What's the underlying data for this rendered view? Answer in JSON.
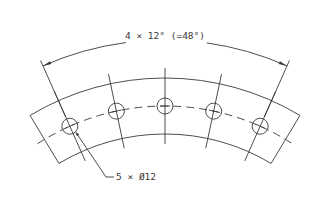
{
  "drawing": {
    "type": "technical-drawing",
    "subject": "curved segment with bolt-hole pattern",
    "angular_dimension": {
      "label": "4 × 12° (=48°)",
      "count": 4,
      "step_deg": 12,
      "total_deg": 48
    },
    "hole_callout": {
      "label": "5 × Ø12",
      "count": 5,
      "diameter": 12
    },
    "line_color": "#3a3a3a",
    "background": "#ffffff"
  }
}
